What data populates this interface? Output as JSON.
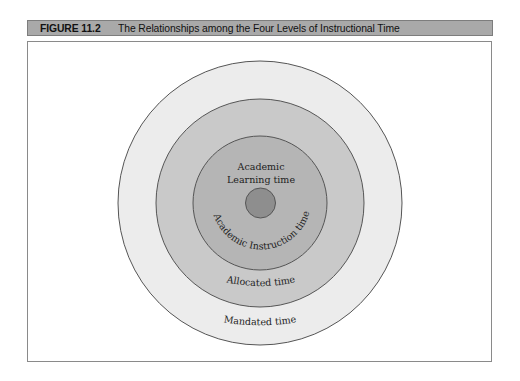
{
  "figure": {
    "label": "FIGURE 11.2",
    "title": "The Relationships among the Four Levels of Instructional Time"
  },
  "diagram": {
    "type": "concentric-circles",
    "center": [
      260,
      203
    ],
    "levels": [
      {
        "name": "Mandated time",
        "radius": 142,
        "fill": "#ececec"
      },
      {
        "name": "Allocated time",
        "radius": 104,
        "fill": "#c9c9c9"
      },
      {
        "name": "Academic Instruction time",
        "radius": 67,
        "fill": "#b5b5b5"
      },
      {
        "name": "Academic Learning time",
        "radius": 15,
        "fill": "#8e8e8e"
      }
    ],
    "labels": {
      "mandated": "Mandated time",
      "allocated": "Allocated time",
      "instruction": "Academic Instruction time",
      "learning_line1": "Academic",
      "learning_line2": "Learning time"
    },
    "stroke_color": "#555555"
  }
}
